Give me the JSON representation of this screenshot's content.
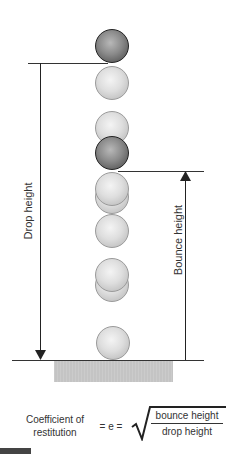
{
  "diagram": {
    "labels": {
      "drop_height": "Drop height",
      "bounce_height": "Bounce height"
    },
    "formula": {
      "lhs_line1": "Coefficient of",
      "lhs_line2": "restitution",
      "equals": "= e =",
      "numerator": "bounce height",
      "denominator": "drop height",
      "radical": "√"
    },
    "balls": [
      {
        "position": "drop start",
        "style": "dark"
      },
      {
        "style": "light"
      },
      {
        "style": "light"
      },
      {
        "position": "bounce peak",
        "style": "dark"
      },
      {
        "style": "light"
      },
      {
        "style": "light"
      },
      {
        "style": "light"
      },
      {
        "style": "light"
      },
      {
        "position": "ground contact",
        "style": "light"
      }
    ],
    "colors": {
      "light_ball": "#dedede",
      "dark_ball": "#6e6e6e",
      "ground": "#c4c4c4",
      "lines": "#333333"
    }
  }
}
